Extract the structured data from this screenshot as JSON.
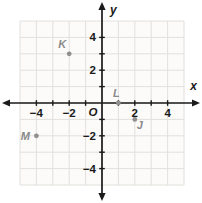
{
  "figure": {
    "width": 202,
    "height": 203
  },
  "chart_data": {
    "type": "scatter",
    "title": "",
    "points": [
      {
        "label": "K",
        "x": -2,
        "y": 3,
        "label_position": "upper-left"
      },
      {
        "label": "L",
        "x": 1,
        "y": 0,
        "label_position": "above"
      },
      {
        "label": "J",
        "x": 2,
        "y": -1,
        "label_position": "below-right"
      },
      {
        "label": "M",
        "x": -4,
        "y": -2,
        "label_position": "left"
      }
    ],
    "axes": {
      "xlabel": "x",
      "ylabel": "y",
      "origin_label": "O",
      "xlim": [
        -5,
        5
      ],
      "ylim": [
        -5,
        5
      ],
      "tick_step": 1,
      "x_tick_labels": [
        {
          "v": -4,
          "t": "−4"
        },
        {
          "v": -2,
          "t": "−2"
        },
        {
          "v": 2,
          "t": "2"
        },
        {
          "v": 4,
          "t": "4"
        }
      ],
      "y_tick_labels": [
        {
          "v": -4,
          "t": "−4"
        },
        {
          "v": -2,
          "t": "−2"
        },
        {
          "v": 2,
          "t": "2"
        },
        {
          "v": 4,
          "t": "4"
        }
      ]
    },
    "grid": true,
    "legend": null,
    "colors": {
      "background": "#ffffff",
      "grid_background": "#fcfbfa",
      "grid_line": "#e2e0dc",
      "axis": "#1a1a1a",
      "tick_label": "#1a1a1a",
      "point": "#8f8f8f",
      "point_label": "#8a8a8a"
    }
  }
}
